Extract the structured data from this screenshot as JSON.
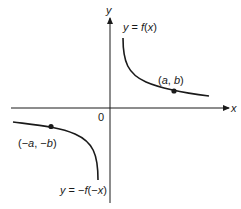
{
  "figure": {
    "axes": {
      "x_label": "x",
      "y_label": "y",
      "origin_label": "0"
    },
    "curves": [
      {
        "name": "f",
        "label": "y = f(x)",
        "quadrant": "I"
      },
      {
        "name": "reflected",
        "label": "y = −f(−x)",
        "quadrant": "III"
      }
    ],
    "points": [
      {
        "name": "point-a-b",
        "label": "(a, b)"
      },
      {
        "name": "point-neg-a-neg-b",
        "label": "(−a, −b)"
      }
    ],
    "colors": {
      "ink": "#1a1a1a",
      "background": "#ffffff"
    }
  }
}
